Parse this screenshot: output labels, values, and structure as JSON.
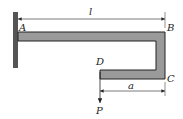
{
  "diagram": {
    "type": "cantilever-frame",
    "points": {
      "A": "A",
      "B": "B",
      "C": "C",
      "D": "D"
    },
    "dimensions": {
      "length_top": "l",
      "length_bottom": "a"
    },
    "load": {
      "label": "P",
      "direction": "down"
    },
    "colors": {
      "beam_fill": "#9a9a9a",
      "stroke": "#222222",
      "wall": "#555555"
    }
  }
}
